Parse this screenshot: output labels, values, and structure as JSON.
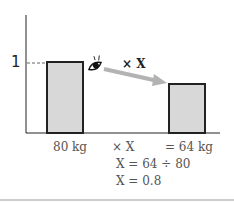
{
  "diagram": {
    "y_axis_label": "1",
    "arrow_label": "× X",
    "bars": [
      {
        "label": "80 kg",
        "relative_height": 1.0,
        "fill": "#d8d8d8",
        "stroke": "#222222"
      },
      {
        "label": "= 64 kg",
        "relative_height": 0.8,
        "fill": "#d8d8d8",
        "stroke": "#222222"
      }
    ],
    "middle_label": "× X",
    "equations": [
      "X = 64 ÷ 80",
      "X = 0.8"
    ],
    "arrow_color": "#b3b3b3",
    "icon": "eye-icon"
  }
}
